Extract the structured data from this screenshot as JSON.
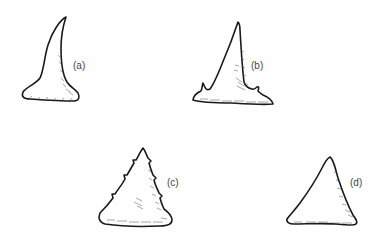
{
  "figure": {
    "teeth": [
      {
        "id": "a",
        "label": "(a)",
        "description": "curved slender tooth"
      },
      {
        "id": "b",
        "label": "(b)",
        "description": "triangular tooth with lateral cusplets"
      },
      {
        "id": "c",
        "label": "(c)",
        "description": "serrated triangular tooth"
      },
      {
        "id": "d",
        "label": "(d)",
        "description": "broad triangular tooth"
      }
    ]
  }
}
